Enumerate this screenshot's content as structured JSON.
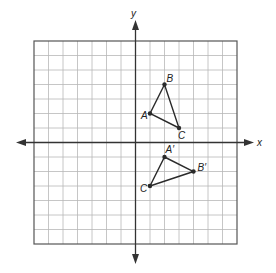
{
  "figure": {
    "title": "",
    "x_axis_label": "x",
    "y_axis_label": "y",
    "grid": {
      "xmin": -7,
      "xmax": 7,
      "ymin": -7,
      "ymax": 7,
      "step": 1
    },
    "colors": {
      "grid": "#b8b8b8",
      "border": "#555555",
      "axis": "#333333",
      "shape": "#2a2a2a"
    },
    "triangles": [
      {
        "name": "ABC",
        "vertices": [
          {
            "label": "A",
            "x": 1,
            "y": 2
          },
          {
            "label": "B",
            "x": 2,
            "y": 4
          },
          {
            "label": "C",
            "x": 3,
            "y": 1
          }
        ]
      },
      {
        "name": "A'B'C'",
        "vertices": [
          {
            "label": "A′",
            "x": 2,
            "y": -1
          },
          {
            "label": "B′",
            "x": 4,
            "y": -2
          },
          {
            "label": "C′",
            "x": 1,
            "y": -3
          }
        ]
      }
    ]
  }
}
